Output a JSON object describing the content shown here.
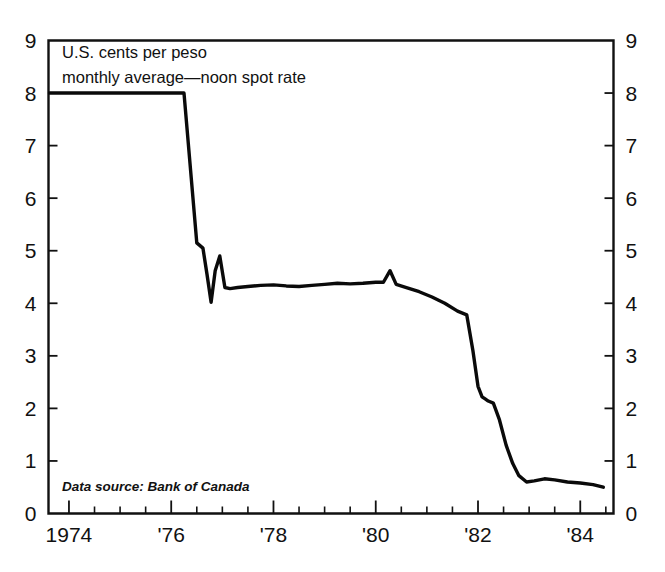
{
  "chart_data": {
    "type": "line",
    "title": "U.S. cents per peso",
    "subtitle": "monthly average—noon spot rate",
    "annotation": "Data source: Bank of Canada",
    "xlabel": "",
    "ylabel": "",
    "ylim": [
      0,
      9
    ],
    "xlim": [
      1973.6,
      1984.65
    ],
    "grid": false,
    "legend": null,
    "y_ticks": [
      0,
      1,
      2,
      3,
      4,
      5,
      6,
      7,
      8,
      9
    ],
    "y_tick_labels": [
      "0",
      "1",
      "2",
      "3",
      "4",
      "5",
      "6",
      "7",
      "8",
      "9"
    ],
    "y_axis_mirrored": true,
    "x_ticks": [
      1974,
      1976,
      1978,
      1980,
      1982,
      1984
    ],
    "x_tick_labels": [
      "1974",
      "'76",
      "'78",
      "'80",
      "'82",
      "'84"
    ],
    "x_minor_tick_interval": 0.5,
    "line_color": "#0a0a0a",
    "series": [
      {
        "name": "Mexican peso, U.S. cents per peso",
        "x": [
          1973.62,
          1974.0,
          1974.5,
          1975.0,
          1975.5,
          1976.0,
          1976.25,
          1976.5,
          1976.62,
          1976.7,
          1976.78,
          1976.86,
          1976.95,
          1977.05,
          1977.15,
          1977.3,
          1977.5,
          1977.75,
          1978.0,
          1978.25,
          1978.5,
          1978.75,
          1979.0,
          1979.25,
          1979.5,
          1979.75,
          1980.0,
          1980.15,
          1980.28,
          1980.4,
          1980.6,
          1980.85,
          1981.1,
          1981.35,
          1981.6,
          1981.78,
          1981.9,
          1982.0,
          1982.08,
          1982.14,
          1982.2,
          1982.3,
          1982.42,
          1982.55,
          1982.68,
          1982.8,
          1982.95,
          1983.1,
          1983.3,
          1983.5,
          1983.75,
          1984.0,
          1984.25,
          1984.45
        ],
        "y": [
          8.0,
          8.0,
          8.0,
          8.0,
          8.0,
          8.0,
          8.0,
          5.15,
          5.05,
          4.55,
          4.02,
          4.62,
          4.9,
          4.3,
          4.28,
          4.3,
          4.32,
          4.34,
          4.35,
          4.33,
          4.32,
          4.34,
          4.36,
          4.38,
          4.37,
          4.38,
          4.4,
          4.4,
          4.62,
          4.36,
          4.3,
          4.22,
          4.12,
          4.0,
          3.85,
          3.78,
          3.1,
          2.42,
          2.22,
          2.18,
          2.14,
          2.1,
          1.78,
          1.3,
          0.95,
          0.72,
          0.6,
          0.62,
          0.66,
          0.64,
          0.6,
          0.58,
          0.55,
          0.5
        ]
      }
    ]
  }
}
